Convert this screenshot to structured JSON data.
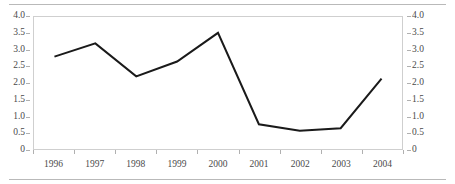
{
  "chart_data": {
    "type": "line",
    "title": "",
    "subtitle": "",
    "xlabel": "",
    "ylabel": "",
    "ylim": [
      0,
      4.0
    ],
    "grid": false,
    "legend": "none",
    "dual_y_axis": true,
    "categories": [
      "1996",
      "1997",
      "1998",
      "1999",
      "2000",
      "2001",
      "2002",
      "2003",
      "2004"
    ],
    "values": [
      2.8,
      3.2,
      2.2,
      2.65,
      3.52,
      0.75,
      0.55,
      0.63,
      2.13
    ],
    "series": [
      {
        "name": "series-1",
        "values": [
          2.8,
          3.2,
          2.2,
          2.65,
          3.52,
          0.75,
          0.55,
          0.63,
          2.13
        ],
        "color": "#1a1a1a",
        "line_width": 2,
        "markers": "none"
      }
    ],
    "y_ticks_left": [
      "4.0",
      "3.5",
      "3.0",
      "2.5",
      "2.0",
      "1.5",
      "1.0",
      "0.5",
      "0"
    ],
    "y_ticks_right": [
      "4.0",
      "3.5",
      "3.0",
      "2.5",
      "2.0",
      "1.5",
      "1.0",
      "0.5",
      "0"
    ],
    "y_tick_values": [
      4.0,
      3.5,
      3.0,
      2.5,
      2.0,
      1.5,
      1.0,
      0.5,
      0
    ],
    "x_ticks": [
      "1996",
      "1997",
      "1998",
      "1999",
      "2000",
      "2001",
      "2002",
      "2003",
      "2004"
    ],
    "annotations": [],
    "colors": {
      "line": "#1a1a1a",
      "axis_text": "#4a4a4a",
      "plot_border": "#cfcfcf",
      "rule": "#b9b9b9",
      "tick": "#b0b0b0",
      "background": "#ffffff"
    }
  }
}
